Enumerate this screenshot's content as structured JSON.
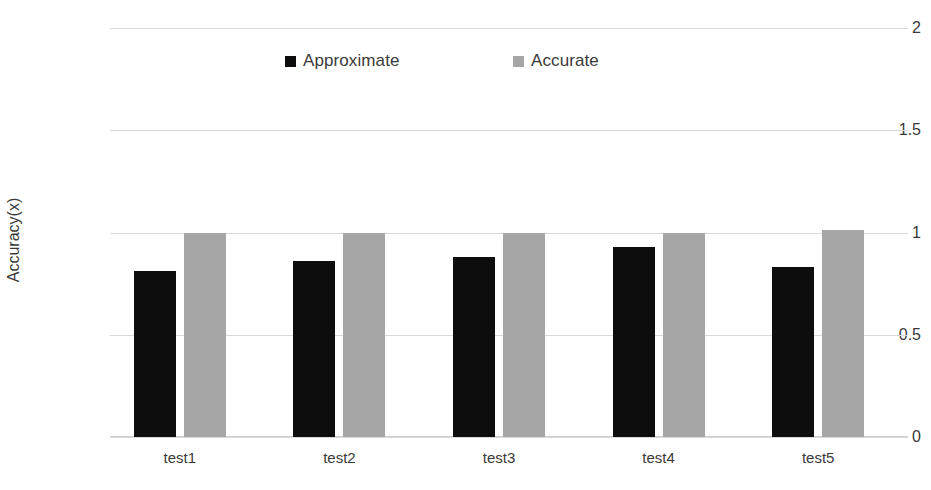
{
  "chart_data": {
    "type": "bar",
    "title": "",
    "xlabel": "",
    "ylabel": "Accuracy(x)",
    "categories": [
      "test1",
      "test2",
      "test3",
      "test4",
      "test5"
    ],
    "series": [
      {
        "name": "Approximate",
        "color": "#0D0D0D",
        "values": [
          0.81,
          0.86,
          0.88,
          0.93,
          0.83
        ]
      },
      {
        "name": "Accurate",
        "color": "#A6A6A6",
        "values": [
          1.0,
          1.0,
          1.0,
          1.0,
          1.01
        ]
      }
    ],
    "ylim": [
      0,
      2
    ],
    "yticks": [
      "0",
      "0.5",
      "1",
      "1.5",
      "2"
    ],
    "ytick_values": [
      0,
      0.5,
      1,
      1.5,
      2
    ],
    "grid": true,
    "legend_position": "top"
  },
  "colors": {
    "background": "#FFFFFF",
    "gridline": "#D9D9D9",
    "text": "#3A3A3A"
  }
}
